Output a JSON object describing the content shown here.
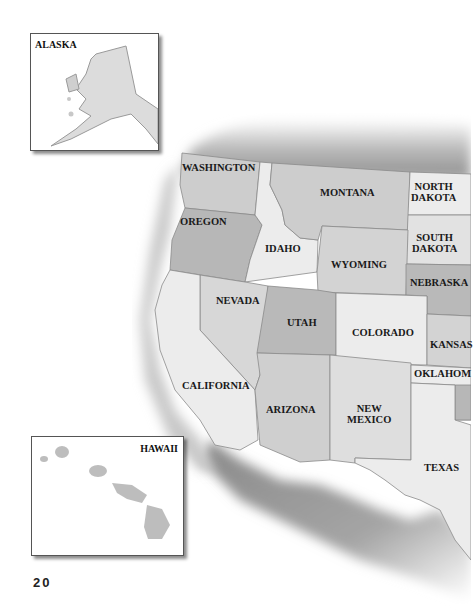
{
  "page": {
    "number": "20"
  },
  "insets": {
    "alaska": {
      "label": "ALASKA"
    },
    "hawaii": {
      "label": "HAWAII"
    }
  },
  "states": {
    "washington": "WASHINGTON",
    "oregon": "OREGON",
    "idaho": "IDAHO",
    "montana": "MONTANA",
    "north_dakota": "NORTH\nDAKOTA",
    "south_dakota": "SOUTH\nDAKOTA",
    "wyoming": "WYOMING",
    "nebraska": "NEBRASKA",
    "nevada": "NEVADA",
    "utah": "UTAH",
    "colorado": "COLORADO",
    "kansas": "KANSAS",
    "california": "CALIFORNIA",
    "arizona": "ARIZONA",
    "new_mexico": "NEW\nMEXICO",
    "oklahoma": "OKLAHOM",
    "texas": "TEXAS"
  },
  "colors": {
    "light": "#ececec",
    "medium": "#cfcfcf",
    "dark": "#b4b4b4",
    "relief": "#9a9a9a"
  }
}
